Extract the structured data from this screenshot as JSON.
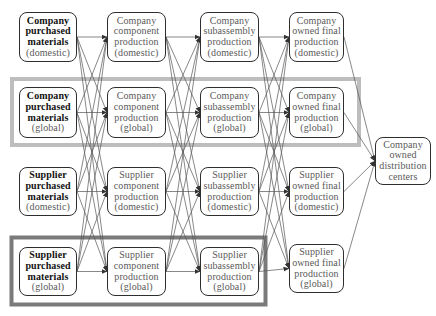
{
  "diagram": {
    "nodes": {
      "c1r1": {
        "lines": [
          "Company",
          "purchased",
          "materials",
          "(domestic)"
        ]
      },
      "c1r2": {
        "lines": [
          "Company",
          "purchased",
          "materials",
          "(global)"
        ]
      },
      "c1r3": {
        "lines": [
          "Supplier",
          "purchased",
          "materials",
          "(domestic)"
        ]
      },
      "c1r4": {
        "lines": [
          "Supplier",
          "purchased",
          "materials",
          "(global)"
        ]
      },
      "c2r1": {
        "lines": [
          "Company",
          "component",
          "production",
          "(domestic)"
        ]
      },
      "c2r2": {
        "lines": [
          "Company",
          "component",
          "production",
          "(global)"
        ]
      },
      "c2r3": {
        "lines": [
          "Supplier",
          "component",
          "production",
          "(domestic)"
        ]
      },
      "c2r4": {
        "lines": [
          "Supplier",
          "component",
          "production",
          "(global)"
        ]
      },
      "c3r1": {
        "lines": [
          "Company",
          "subassembly",
          "production",
          "(domestic)"
        ]
      },
      "c3r2": {
        "lines": [
          "Company",
          "subassembly",
          "production",
          "(global)"
        ]
      },
      "c3r3": {
        "lines": [
          "Supplier",
          "subassembly",
          "production",
          "(domestic)"
        ]
      },
      "c3r4": {
        "lines": [
          "Supplier",
          "subassembly",
          "production",
          "(global)"
        ]
      },
      "c4r1": {
        "lines": [
          "Company",
          "owned final",
          "production",
          "(domestic)"
        ]
      },
      "c4r2": {
        "lines": [
          "Company",
          "owned final",
          "production",
          "(global)"
        ]
      },
      "c4r3": {
        "lines": [
          "Supplier",
          "owned final",
          "production",
          "(domestic)"
        ]
      },
      "c4r4": {
        "lines": [
          "Supplier",
          "owned final",
          "production",
          "(global)"
        ]
      },
      "dist": {
        "lines": [
          "Company",
          "owned",
          "distribution",
          "centers"
        ]
      }
    },
    "edges": [
      "c1r1>c2r1",
      "c1r1>c2r2",
      "c1r1>c2r3",
      "c1r1>c2r4",
      "c1r2>c2r1",
      "c1r2>c2r2",
      "c1r2>c2r3",
      "c1r2>c2r4",
      "c1r3>c2r1",
      "c1r3>c2r2",
      "c1r3>c2r3",
      "c1r3>c2r4",
      "c1r4>c2r1",
      "c1r4>c2r2",
      "c1r4>c2r3",
      "c1r4>c2r4",
      "c2r1>c3r1",
      "c2r1>c3r2",
      "c2r1>c3r3",
      "c2r1>c3r4",
      "c2r2>c3r1",
      "c2r2>c3r2",
      "c2r2>c3r3",
      "c2r2>c3r4",
      "c2r3>c3r1",
      "c2r3>c3r2",
      "c2r3>c3r3",
      "c2r3>c3r4",
      "c2r4>c3r1",
      "c2r4>c3r2",
      "c2r4>c3r3",
      "c2r4>c3r4",
      "c3r1>c4r1",
      "c3r1>c4r2",
      "c3r1>c4r3",
      "c3r1>c4r4",
      "c3r2>c4r1",
      "c3r2>c4r2",
      "c3r2>c4r3",
      "c3r2>c4r4",
      "c3r3>c4r1",
      "c3r3>c4r2",
      "c3r3>c4r3",
      "c3r3>c4r4",
      "c3r4>c4r1",
      "c3r4>c4r2",
      "c3r4>c4r3",
      "c3r4>c4r4",
      "c4r1>dist",
      "c4r2>dist",
      "c4r3>dist",
      "c4r4>dist"
    ],
    "highlights": {
      "company_global": {
        "color": "#bdbdbd"
      },
      "supplier_global": {
        "color": "#7a7a7a"
      }
    },
    "colors": {
      "edge": "#555555",
      "node_border": "#2e2e2e"
    }
  }
}
